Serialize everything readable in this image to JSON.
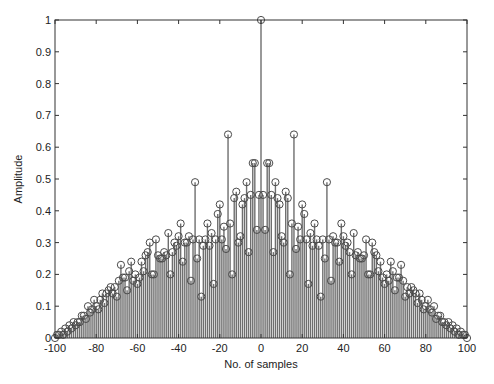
{
  "chart_data": {
    "type": "stem",
    "title": "",
    "xlabel": "No. of samples",
    "ylabel": "Amplitude",
    "xlim": [
      -100,
      100
    ],
    "ylim": [
      0,
      1
    ],
    "xticks": [
      -100,
      -80,
      -60,
      -40,
      -20,
      0,
      20,
      40,
      60,
      80,
      100
    ],
    "yticks": [
      0,
      0.1,
      0.2,
      0.3,
      0.4,
      0.5,
      0.6,
      0.7,
      0.8,
      0.9,
      1
    ],
    "ytick_labels": [
      "0",
      "0.1",
      "0.2",
      "0.3",
      "0.4",
      "0.5",
      "0.6",
      "0.7",
      "0.8",
      "0.9",
      "1"
    ],
    "grid": false,
    "symmetric": true,
    "note": "Values for lags 0..100; negative lags mirror positive lags.",
    "lags": [
      0,
      1,
      2,
      3,
      4,
      5,
      6,
      7,
      8,
      9,
      10,
      11,
      12,
      13,
      14,
      15,
      16,
      17,
      18,
      19,
      20,
      21,
      22,
      23,
      24,
      25,
      26,
      27,
      28,
      29,
      30,
      31,
      32,
      33,
      34,
      35,
      36,
      37,
      38,
      39,
      40,
      41,
      42,
      43,
      44,
      45,
      46,
      47,
      48,
      49,
      50,
      51,
      52,
      53,
      54,
      55,
      56,
      57,
      58,
      59,
      60,
      61,
      62,
      63,
      64,
      65,
      66,
      67,
      68,
      69,
      70,
      71,
      72,
      73,
      74,
      75,
      76,
      77,
      78,
      79,
      80,
      81,
      82,
      83,
      84,
      85,
      86,
      87,
      88,
      89,
      90,
      91,
      92,
      93,
      94,
      95,
      96,
      97,
      98,
      99,
      100
    ],
    "values": [
      1.0,
      0.45,
      0.34,
      0.55,
      0.55,
      0.45,
      0.27,
      0.49,
      0.44,
      0.42,
      0.32,
      0.3,
      0.46,
      0.44,
      0.2,
      0.36,
      0.64,
      0.28,
      0.35,
      0.31,
      0.42,
      0.39,
      0.31,
      0.17,
      0.33,
      0.29,
      0.36,
      0.31,
      0.29,
      0.13,
      0.31,
      0.25,
      0.49,
      0.31,
      0.18,
      0.32,
      0.3,
      0.3,
      0.24,
      0.36,
      0.32,
      0.29,
      0.3,
      0.27,
      0.2,
      0.33,
      0.26,
      0.27,
      0.25,
      0.25,
      0.26,
      0.31,
      0.2,
      0.2,
      0.3,
      0.27,
      0.26,
      0.21,
      0.24,
      0.19,
      0.17,
      0.2,
      0.18,
      0.24,
      0.21,
      0.15,
      0.19,
      0.19,
      0.23,
      0.18,
      0.13,
      0.16,
      0.14,
      0.16,
      0.15,
      0.14,
      0.11,
      0.14,
      0.12,
      0.09,
      0.1,
      0.12,
      0.09,
      0.08,
      0.1,
      0.06,
      0.07,
      0.07,
      0.05,
      0.05,
      0.04,
      0.05,
      0.03,
      0.04,
      0.02,
      0.03,
      0.01,
      0.02,
      0.01,
      0.01,
      0.0
    ],
    "colors": {
      "stem": "#6e6e6e",
      "marker": "#4a4a4a",
      "axes": "#333333"
    }
  }
}
